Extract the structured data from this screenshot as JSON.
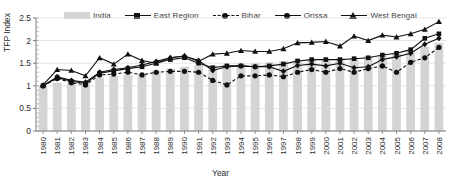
{
  "chart_data": {
    "type": "bar",
    "title": "",
    "xlabel": "Year",
    "ylabel": "TFP Index",
    "ylim": [
      0,
      2.5
    ],
    "ytick_values": [
      0,
      0.5,
      1,
      1.5,
      2,
      2.5
    ],
    "ytick_labels": [
      "0",
      "0.5",
      "1",
      "1.5",
      "2",
      "2.5"
    ],
    "grid": true,
    "legend_position": "top",
    "categories": [
      "1980",
      "1981",
      "1982",
      "1983",
      "1984",
      "1985",
      "1986",
      "1987",
      "1988",
      "1989",
      "1990",
      "1991",
      "1992",
      "1993",
      "1994",
      "1995",
      "1996",
      "1997",
      "1998",
      "1999",
      "2000",
      "2001",
      "2002",
      "2003",
      "2004",
      "2005",
      "2006",
      "2007",
      "2008"
    ],
    "series": [
      {
        "name": "India",
        "type": "bar",
        "color": "#d4d4d4",
        "values": [
          1.0,
          1.07,
          1.07,
          1.1,
          1.18,
          1.22,
          1.24,
          1.26,
          1.33,
          1.38,
          1.42,
          1.45,
          1.45,
          1.47,
          1.49,
          1.5,
          1.52,
          1.55,
          1.57,
          1.58,
          1.6,
          1.6,
          1.62,
          1.66,
          1.68,
          1.72,
          1.78,
          1.86,
          1.95
        ]
      },
      {
        "name": "East Region",
        "type": "line",
        "marker": "square",
        "dash": "solid",
        "color": "#111111",
        "values": [
          1.0,
          1.18,
          1.1,
          1.05,
          1.28,
          1.33,
          1.38,
          1.42,
          1.5,
          1.58,
          1.62,
          1.5,
          1.4,
          1.44,
          1.44,
          1.42,
          1.44,
          1.48,
          1.55,
          1.58,
          1.58,
          1.58,
          1.6,
          1.62,
          1.68,
          1.72,
          1.8,
          2.05,
          2.15
        ]
      },
      {
        "name": "Bihar",
        "type": "line",
        "marker": "circle",
        "dash": "dashed",
        "color": "#111111",
        "values": [
          1.0,
          1.16,
          1.07,
          1.02,
          1.24,
          1.26,
          1.3,
          1.24,
          1.3,
          1.32,
          1.32,
          1.3,
          1.12,
          1.02,
          1.22,
          1.22,
          1.24,
          1.2,
          1.3,
          1.36,
          1.3,
          1.38,
          1.3,
          1.38,
          1.44,
          1.3,
          1.52,
          1.62,
          1.85
        ]
      },
      {
        "name": "Orissa",
        "type": "line",
        "marker": "diamond",
        "dash": "solid",
        "color": "#111111",
        "values": [
          1.0,
          1.2,
          1.12,
          1.08,
          1.3,
          1.36,
          1.4,
          1.46,
          1.54,
          1.62,
          1.66,
          1.56,
          1.34,
          1.42,
          1.44,
          1.42,
          1.42,
          1.32,
          1.45,
          1.48,
          1.44,
          1.5,
          1.4,
          1.42,
          1.58,
          1.64,
          1.72,
          1.92,
          2.05
        ]
      },
      {
        "name": "West Bengal",
        "type": "line",
        "marker": "triangle",
        "dash": "solid",
        "color": "#111111",
        "values": [
          1.02,
          1.36,
          1.34,
          1.22,
          1.62,
          1.48,
          1.7,
          1.56,
          1.5,
          1.62,
          1.66,
          1.54,
          1.7,
          1.72,
          1.78,
          1.76,
          1.76,
          1.82,
          1.95,
          1.96,
          1.98,
          1.88,
          2.1,
          2.0,
          2.12,
          2.08,
          2.15,
          2.25,
          2.42
        ]
      }
    ]
  },
  "legend": {
    "items": [
      {
        "label": "India",
        "style": "bar"
      },
      {
        "label": "East Region",
        "style": "line-square"
      },
      {
        "label": "Bihar",
        "style": "line-dashed-circle"
      },
      {
        "label": "Orissa",
        "style": "line-diamond"
      },
      {
        "label": "West Bengal",
        "style": "line-triangle"
      }
    ]
  }
}
